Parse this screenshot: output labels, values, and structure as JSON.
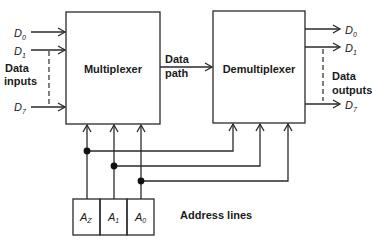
{
  "diagram": {
    "type": "multiplexer-demultiplexer block diagram",
    "blocks": {
      "multiplexer": {
        "label": "Multiplexer"
      },
      "demultiplexer": {
        "label": "Demultiplexer"
      }
    },
    "data_path": {
      "line1": "Data",
      "line2": "path"
    },
    "inputs": {
      "group_label_line1": "Data",
      "group_label_line2": "inputs",
      "signals": [
        {
          "name": "D",
          "sub": "0"
        },
        {
          "name": "D",
          "sub": "1"
        },
        {
          "name": "D",
          "sub": "7"
        }
      ]
    },
    "outputs": {
      "group_label_line1": "Data",
      "group_label_line2": "outputs",
      "signals": [
        {
          "name": "D",
          "sub": "0"
        },
        {
          "name": "D",
          "sub": "1"
        },
        {
          "name": "D",
          "sub": "7"
        }
      ]
    },
    "address": {
      "label": "Address lines",
      "cells": [
        {
          "name": "A",
          "sub": "Z"
        },
        {
          "name": "A",
          "sub": "1"
        },
        {
          "name": "A",
          "sub": "0"
        }
      ]
    }
  }
}
